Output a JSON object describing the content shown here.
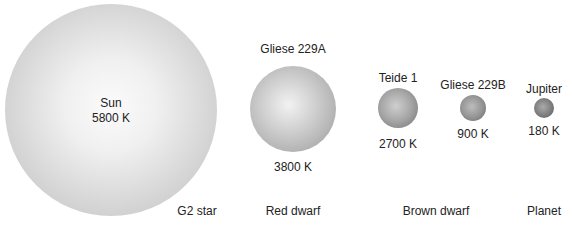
{
  "bodies": [
    {
      "name": "Sun",
      "temperature": "5800 K"
    },
    {
      "name": "Gliese 229A",
      "temperature": "3800 K"
    },
    {
      "name": "Teide 1",
      "temperature": "2700 K"
    },
    {
      "name": "Gliese 229B",
      "temperature": "900 K"
    },
    {
      "name": "Jupiter",
      "temperature": "180 K"
    }
  ],
  "categories": [
    "G2 star",
    "Red dwarf",
    "Brown dwarf",
    "Planet"
  ],
  "colors": {
    "background": "#ffffff",
    "text": "#222222",
    "sphere_light": "#f5f5f5",
    "sphere_dark": "#666666"
  }
}
